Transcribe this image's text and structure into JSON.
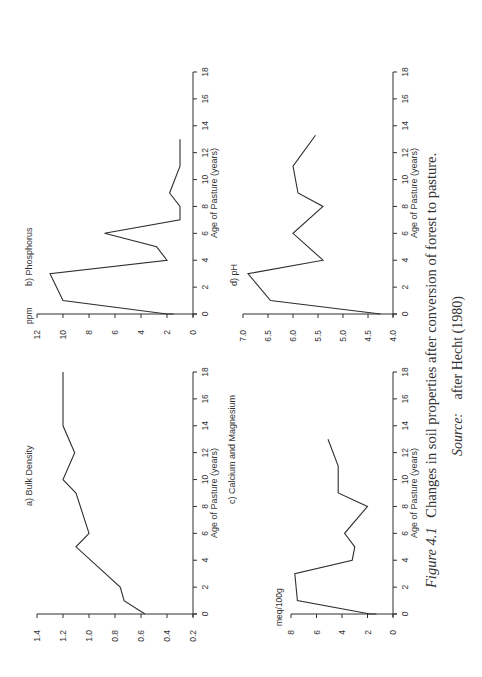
{
  "figure": {
    "caption_label": "Figure 4.1",
    "caption_text": "Changes in soil properties after conversion of forest to pasture.",
    "source_label": "Source:",
    "source_text": "after Hecht (1980)"
  },
  "chart_data": [
    {
      "id": "a",
      "type": "line",
      "title": "a) Bulk Density",
      "xlabel": "Age of Pasture (years)",
      "ylabel": "",
      "xlim": [
        0,
        18
      ],
      "ylim": [
        0.2,
        1.4
      ],
      "xticks": [
        0,
        2,
        4,
        6,
        8,
        10,
        12,
        14,
        16,
        18
      ],
      "yticks": [
        0.2,
        0.4,
        0.6,
        0.8,
        1.0,
        1.2,
        1.4
      ],
      "ytick_labels": [
        "0.2",
        "0.4",
        "0.6",
        "0.8",
        "1.0",
        "1.2",
        "1.4"
      ],
      "x": [
        0,
        1,
        2,
        5,
        6,
        9,
        10,
        12,
        14,
        18
      ],
      "y": [
        0.57,
        0.73,
        0.76,
        1.1,
        1.0,
        1.1,
        1.2,
        1.11,
        1.2,
        1.2
      ],
      "grid": false
    },
    {
      "id": "b",
      "type": "line",
      "title": "b) Phosphorus",
      "xlabel": "Age of Pasture (years)",
      "ylabel": "ppm",
      "xlim": [
        0,
        18
      ],
      "ylim": [
        0,
        12
      ],
      "xticks": [
        0,
        2,
        4,
        6,
        8,
        10,
        12,
        14,
        16,
        18
      ],
      "yticks": [
        0,
        2,
        4,
        6,
        8,
        10,
        12
      ],
      "ytick_labels": [
        "0",
        "2",
        "4",
        "6",
        "8",
        "10",
        "12"
      ],
      "x": [
        0,
        0,
        1,
        3,
        4,
        5,
        6,
        7,
        8,
        9,
        11,
        13
      ],
      "y": [
        1.5,
        2.0,
        10.0,
        11.0,
        2.0,
        2.8,
        6.8,
        1.0,
        1.0,
        1.8,
        1.0,
        1.0
      ],
      "grid": false
    },
    {
      "id": "c",
      "type": "line",
      "title": "c) Calcium and Magnesium",
      "xlabel": "Age of Pasture (years)",
      "ylabel": "meq/100g",
      "xlim": [
        0,
        18
      ],
      "ylim": [
        0,
        8
      ],
      "xticks": [
        0,
        2,
        4,
        6,
        8,
        10,
        12,
        14,
        16,
        18
      ],
      "yticks": [
        0,
        2,
        4,
        6,
        8
      ],
      "ytick_labels": [
        "0",
        "2",
        "4",
        "6",
        "8"
      ],
      "x": [
        0,
        0,
        1,
        3,
        4,
        5,
        6,
        8,
        9,
        11,
        13
      ],
      "y": [
        1.3,
        1.8,
        7.5,
        7.7,
        3.2,
        3.0,
        3.8,
        2.0,
        4.3,
        4.3,
        5.1
      ],
      "grid": false
    },
    {
      "id": "d",
      "type": "line",
      "title": "d) pH",
      "xlabel": "Age of Pasture (years)",
      "ylabel": "",
      "xlim": [
        0,
        18
      ],
      "ylim": [
        4.0,
        7.0
      ],
      "xticks": [
        0,
        2,
        4,
        6,
        8,
        10,
        12,
        14,
        16,
        18
      ],
      "yticks": [
        4.0,
        4.5,
        5.0,
        5.5,
        6.0,
        6.5,
        7.0
      ],
      "ytick_labels": [
        "4.0",
        "4.5",
        "5.0",
        "5.5",
        "6.0",
        "6.5",
        "7.0"
      ],
      "x": [
        0,
        1,
        3,
        4,
        6,
        8,
        9,
        11,
        13.3
      ],
      "y": [
        4.25,
        6.45,
        6.9,
        5.4,
        6.0,
        5.4,
        5.9,
        6.0,
        5.55
      ],
      "grid": false
    }
  ],
  "layout": {
    "line_color": "#2f2f2f",
    "panels": {
      "a": {
        "vx0": 193,
        "vx1": 37,
        "ty0": 614,
        "ty1": 372
      },
      "b": {
        "vx0": 193,
        "vx1": 37,
        "ty0": 314,
        "ty1": 72
      },
      "c": {
        "vx0": 393,
        "vx1": 291,
        "ty0": 614,
        "ty1": 372
      },
      "d": {
        "vx0": 393,
        "vx1": 243,
        "ty0": 314,
        "ty1": 72
      }
    }
  }
}
